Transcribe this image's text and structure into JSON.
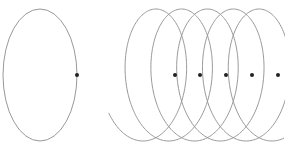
{
  "diagram": {
    "background": "#ffffff",
    "stroke_color": "#999999",
    "dot_color": "#222222",
    "circle": {
      "cx": 40,
      "cy": 75,
      "rx": 37,
      "ry": 66,
      "marker": {
        "x": 77,
        "y": 75
      }
    },
    "helix": {
      "start_center_x": 139,
      "advance_per_turn": 25.8,
      "rx": 37,
      "ry": 66,
      "cy": 75,
      "turn_start_angle_deg": 215,
      "total_turns": 5.2,
      "markers": [
        {
          "x": 175,
          "y": 75
        },
        {
          "x": 200,
          "y": 75
        },
        {
          "x": 226,
          "y": 75
        },
        {
          "x": 252,
          "y": 75
        },
        {
          "x": 278,
          "y": 75
        }
      ]
    }
  }
}
